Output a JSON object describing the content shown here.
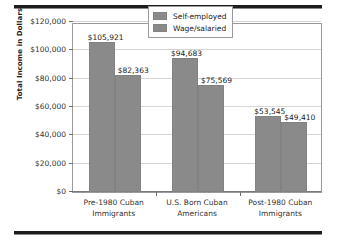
{
  "chart_data": {
    "type": "bar",
    "title": "",
    "xlabel": "",
    "ylabel": "Total Income in Dollars",
    "categories": [
      "Pre-1980 Cuban Immigrants",
      "U.S. Born Cuban Americans",
      "Post-1980 Cuban Immigrants"
    ],
    "category_lines": [
      [
        "Pre-1980 Cuban",
        "Immigrants"
      ],
      [
        "U.S. Born Cuban",
        "Americans"
      ],
      [
        "Post-1980 Cuban",
        "Immigrants"
      ]
    ],
    "series": [
      {
        "name": "Self-employed",
        "color": "#8a8a8a",
        "values": [
          105921,
          94683,
          53545
        ],
        "labels": [
          "$105,921",
          "$94,683",
          "$53,545"
        ]
      },
      {
        "name": "Wage/salaried",
        "color": "#8a8a8a",
        "values": [
          82363,
          75569,
          49410
        ],
        "labels": [
          "$82,363",
          "$75,569",
          "$49,410"
        ]
      }
    ],
    "ylim": [
      0,
      120000
    ],
    "yticks": [
      0,
      20000,
      40000,
      60000,
      80000,
      100000,
      120000
    ],
    "ytick_labels": [
      "$0",
      "$20,000",
      "$40,000",
      "$60,000",
      "$80,000",
      "$100,000",
      "$120,000"
    ],
    "grid": true,
    "legend_position": "top-right"
  },
  "legend": {
    "entries": [
      {
        "label": "Self-employed"
      },
      {
        "label": "Wage/salaried"
      }
    ]
  },
  "axis": {
    "y_title": "Total Income in Dollars"
  }
}
